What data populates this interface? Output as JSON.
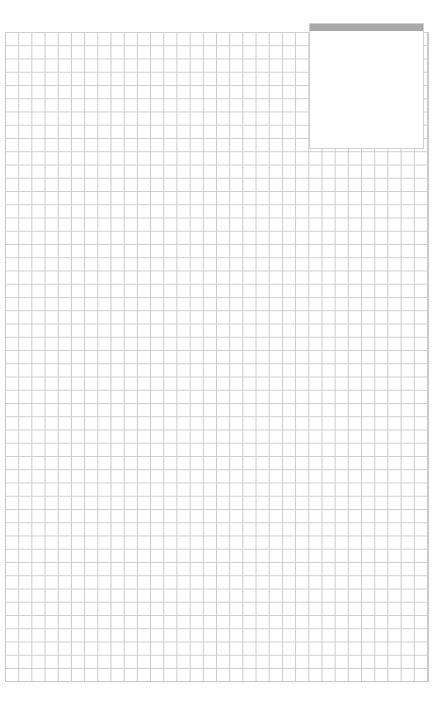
{
  "page": {
    "type": "graph-paper",
    "grid": {
      "columns": 32,
      "rows": 49,
      "line_color": "#c9c9c9",
      "background": "#ffffff"
    }
  },
  "label_box": {
    "header_color": "#a9a9a9",
    "text": ""
  }
}
